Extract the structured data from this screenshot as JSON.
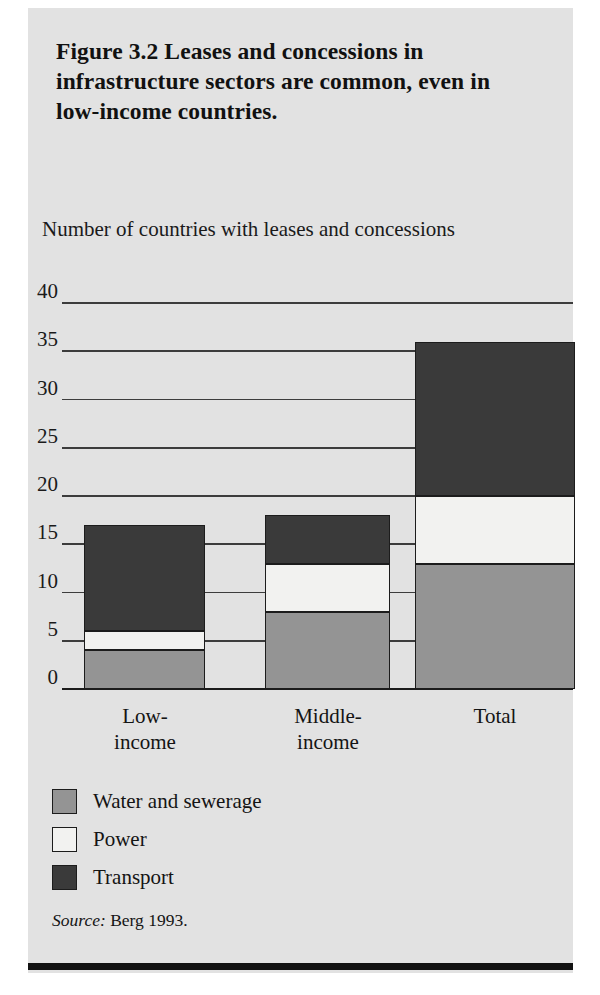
{
  "figure": {
    "title": "Figure 3.2  Leases and concessions in infrastructure sectors are common, even in low-income countries.",
    "source_keyword": "Source:",
    "source_text": "Berg 1993."
  },
  "chart_data": {
    "type": "bar",
    "subtype": "stacked",
    "title": "Figure 3.2  Leases and concessions in infrastructure sectors are common, even in low-income countries.",
    "ylabel": "Number of countries with leases and concessions",
    "xlabel": "",
    "categories": [
      "Low-income",
      "Middle-income",
      "Total"
    ],
    "category_lines": [
      [
        "Low-",
        "income"
      ],
      [
        "Middle-",
        "income"
      ],
      [
        "Total"
      ]
    ],
    "series": [
      {
        "name": "Water and sewerage",
        "color": "#949494",
        "values": [
          4,
          8,
          13
        ]
      },
      {
        "name": "Power",
        "color": "#f2f2f0",
        "values": [
          2,
          5,
          7
        ]
      },
      {
        "name": "Transport",
        "color": "#3a3a3a",
        "values": [
          11,
          5,
          16
        ]
      }
    ],
    "totals": [
      17,
      18,
      36
    ],
    "ylim": [
      0,
      40
    ],
    "yticks": [
      0,
      5,
      10,
      15,
      20,
      25,
      30,
      35,
      40
    ],
    "ytick_labels": [
      "0",
      "5",
      "10",
      "15",
      "20",
      "25",
      "30",
      "35",
      "40"
    ],
    "grid": true,
    "legend_position": "below-plot"
  },
  "legend": {
    "items": [
      {
        "label": "Water and sewerage",
        "color": "#949494"
      },
      {
        "label": "Power",
        "color": "#f2f2f0"
      },
      {
        "label": "Transport",
        "color": "#3a3a3a"
      }
    ]
  }
}
